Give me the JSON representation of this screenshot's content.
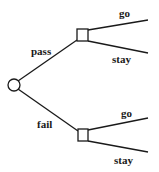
{
  "diagram": {
    "type": "decision-tree",
    "root": {
      "shape": "circle",
      "kind": "chance-node"
    },
    "branches": [
      {
        "label": "pass",
        "node": {
          "shape": "square",
          "kind": "decision-node"
        },
        "options": [
          {
            "label": "go"
          },
          {
            "label": "stay"
          }
        ]
      },
      {
        "label": "fail",
        "node": {
          "shape": "square",
          "kind": "decision-node"
        },
        "options": [
          {
            "label": "go"
          },
          {
            "label": "stay"
          }
        ]
      }
    ]
  }
}
